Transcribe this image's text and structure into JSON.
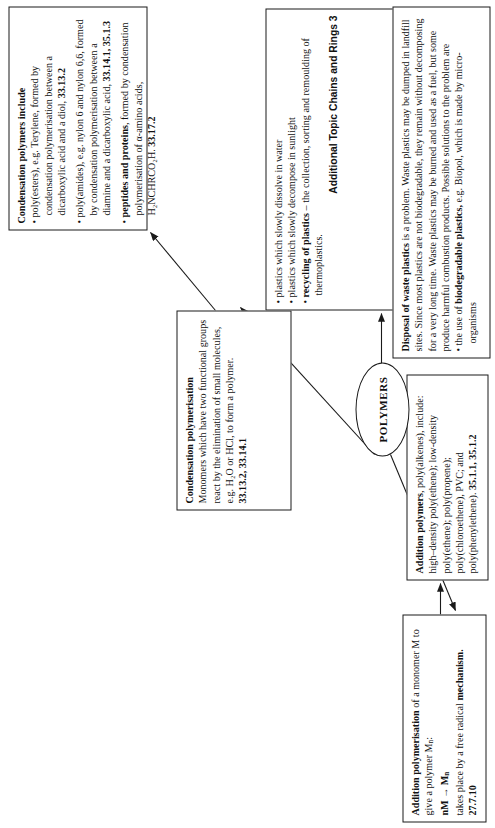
{
  "diagram": {
    "hub_label": "POLYMERS",
    "nodes": {
      "condensation_polymers": {
        "heading": "Condensation polymers include",
        "bullets": [
          {
            "text": "poly(esters), e.g. Terylene, formed by condensation polymerisation between a dicarboxylic acid and a diol,",
            "ref": "33.13.2"
          },
          {
            "text": "poly(amides), e.g. nylon 6 and nylon 6,6, formed by condensation polymerisation between a diamine and a dicarboxylic acid,",
            "ref": "33.14.1, 35.1.3"
          },
          {
            "text_bold": "peptides and proteins",
            "text": ", formed by condensation polymerisation of α-amino acids, H₂NCHRCO₂H.",
            "ref": "33.17.2"
          }
        ]
      },
      "condensation_polymerisation": {
        "heading": "Condensation polymerisation",
        "body": "Monomers which have two functional groups react by the elimination of small molecules, e.g. H₂O or HCl, to form a polymer.",
        "ref": "33.13.2, 33.14.1"
      },
      "addition_polymerisation": {
        "heading": "Addition polymerisation",
        "body_1": " of a monomer M to give a polymer M",
        "body_1_sub": "n",
        "body_1_tail": ":",
        "equation": "nM → M",
        "equation_sub": "n",
        "body_2": "takes place by a free radical ",
        "body_2_bold": "mechanism.",
        "ref": "27.7.10"
      },
      "addition_polymers": {
        "heading": "Addition polymers",
        "body": ", poly(alkenes), include: high–density poly(ethene); low-density poly(ethene); poly(propene); poly(chloroethene), PVC; and poly(phenylethene).",
        "ref": "35.1.1, 35.1.2"
      },
      "plastics_and_recycling": {
        "bullets": [
          {
            "text": "plastics which slowly dissolve in water"
          },
          {
            "text": "plastics which slowly decompose in sunlight"
          },
          {
            "text_bold": "recycling of plastics",
            "text": " – the collection, sorting and remoulding of thermoplastics."
          }
        ],
        "footer": "Additional Topic Chains and Rings 3"
      },
      "disposal": {
        "heading": "Disposal of waste plastics",
        "body": " is a problem. Waste plastics may be dumped in landfill sites. Since most plastics are not biodegradable, they remain without decomposing for a very long time. Waste plastics may be burned and used as a fuel, but some produce harmful combustion products. Possible solutions to the problem are",
        "bullet_lead": "the use of ",
        "bullet_bold": "biodegradable plastics,",
        "bullet_tail": " e.g. Biopol, which is made by micro-organisms"
      }
    },
    "colors": {
      "ink": "#1a1a1a",
      "paper": "#ffffff"
    }
  }
}
